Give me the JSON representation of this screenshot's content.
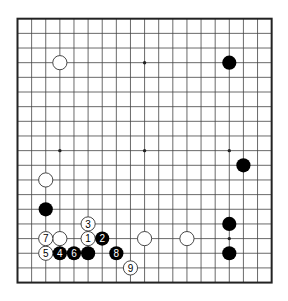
{
  "diagram": {
    "type": "go-board",
    "size": 19,
    "geometry": {
      "x0": 17.5,
      "y0": 18.7,
      "dx": 14.12,
      "dy": 14.66,
      "stone_radius": 7.1,
      "hoshi_radius": 1.7
    },
    "colors": {
      "background": "#ffffff",
      "line": "#444444",
      "border": "#222222",
      "black_stone": "#000000",
      "white_stone_fill": "#ffffff",
      "white_stone_stroke": "#333333",
      "label_on_black": "#ffffff",
      "label_on_white": "#000000"
    },
    "hoshi": [
      {
        "col": 3,
        "row": 3
      },
      {
        "col": 9,
        "row": 3
      },
      {
        "col": 15,
        "row": 3
      },
      {
        "col": 3,
        "row": 9
      },
      {
        "col": 9,
        "row": 9
      },
      {
        "col": 15,
        "row": 9
      },
      {
        "col": 3,
        "row": 15
      },
      {
        "col": 9,
        "row": 15
      },
      {
        "col": 15,
        "row": 15
      }
    ],
    "stones": [
      {
        "color": "white",
        "col": 3,
        "row": 3,
        "label": ""
      },
      {
        "color": "black",
        "col": 15,
        "row": 3,
        "label": ""
      },
      {
        "color": "black",
        "col": 16,
        "row": 10,
        "label": ""
      },
      {
        "color": "white",
        "col": 2,
        "row": 11,
        "label": ""
      },
      {
        "color": "black",
        "col": 2,
        "row": 13,
        "label": ""
      },
      {
        "color": "black",
        "col": 15,
        "row": 14,
        "label": ""
      },
      {
        "color": "white",
        "col": 3,
        "row": 15,
        "label": ""
      },
      {
        "color": "white",
        "col": 9,
        "row": 15,
        "label": ""
      },
      {
        "color": "white",
        "col": 12,
        "row": 15,
        "label": ""
      },
      {
        "color": "black",
        "col": 15,
        "row": 16,
        "label": ""
      },
      {
        "color": "black",
        "col": 5,
        "row": 16,
        "label": ""
      },
      {
        "color": "white",
        "col": 5,
        "row": 15,
        "label": "1"
      },
      {
        "color": "black",
        "col": 6,
        "row": 15,
        "label": "2"
      },
      {
        "color": "white",
        "col": 5,
        "row": 14,
        "label": "3"
      },
      {
        "color": "black",
        "col": 3,
        "row": 16,
        "label": "4"
      },
      {
        "color": "white",
        "col": 2,
        "row": 16,
        "label": "5"
      },
      {
        "color": "black",
        "col": 4,
        "row": 16,
        "label": "6"
      },
      {
        "color": "white",
        "col": 2,
        "row": 15,
        "label": "7"
      },
      {
        "color": "black",
        "col": 7,
        "row": 16,
        "label": "8"
      },
      {
        "color": "white",
        "col": 8,
        "row": 17,
        "label": "9"
      }
    ]
  }
}
